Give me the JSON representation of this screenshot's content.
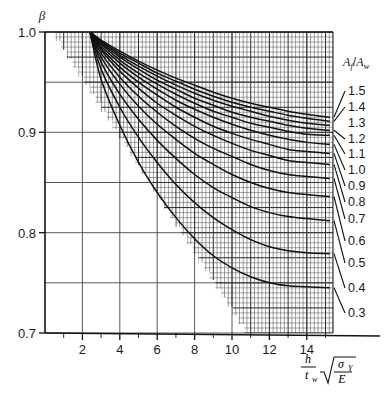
{
  "chart_data": {
    "type": "line",
    "title": "",
    "ylabel": "β",
    "xlabel": "(h/t_w)√(σ_y/E)",
    "xlabel_parts": {
      "num": "h",
      "den": "t",
      "den_sub": "w",
      "radicand_num": "σ",
      "radicand_num_sub": "Y",
      "radicand_den": "E"
    },
    "xlim": [
      0,
      15.4
    ],
    "ylim": [
      0.7,
      1.0
    ],
    "xticks": [
      2,
      4,
      6,
      8,
      10,
      12,
      14
    ],
    "xtick_labels": [
      "2",
      "4",
      "6",
      "8",
      "10",
      "12",
      "14"
    ],
    "yticks": [
      0.7,
      0.8,
      0.9,
      1.0
    ],
    "ytick_labels": [
      "0.7",
      "0.8",
      "0.9",
      "1.0"
    ],
    "y_minor_ticks": [
      0.75,
      0.85,
      0.95
    ],
    "grid": true,
    "grid_note": "fine rectangular mesh over upper-right wedge; coarse major grid over whole frame",
    "legend_position": "right",
    "legend_title": "Af/Aw",
    "legend_title_parts": {
      "main": "A",
      "sub1": "f",
      "slash": "/",
      "main2": "A",
      "sub2": "w"
    },
    "convergence_point": {
      "x": 2.4,
      "y": 1.0
    },
    "series": [
      {
        "name": "1.5",
        "label": "1.5",
        "end_y": 0.915,
        "points": [
          [
            2.4,
            1.0
          ],
          [
            3,
            0.992
          ],
          [
            4,
            0.981
          ],
          [
            5,
            0.971
          ],
          [
            6,
            0.962
          ],
          [
            7,
            0.954
          ],
          [
            8,
            0.947
          ],
          [
            9,
            0.94
          ],
          [
            10,
            0.934
          ],
          [
            11,
            0.929
          ],
          [
            12,
            0.925
          ],
          [
            13,
            0.921
          ],
          [
            14,
            0.918
          ],
          [
            15.2,
            0.915
          ]
        ]
      },
      {
        "name": "1.4",
        "label": "1.4",
        "end_y": 0.911,
        "points": [
          [
            2.4,
            1.0
          ],
          [
            3,
            0.991
          ],
          [
            4,
            0.979
          ],
          [
            5,
            0.969
          ],
          [
            6,
            0.959
          ],
          [
            7,
            0.951
          ],
          [
            8,
            0.943
          ],
          [
            9,
            0.936
          ],
          [
            10,
            0.93
          ],
          [
            11,
            0.925
          ],
          [
            12,
            0.921
          ],
          [
            13,
            0.917
          ],
          [
            14,
            0.914
          ],
          [
            15.2,
            0.911
          ]
        ]
      },
      {
        "name": "1.3",
        "label": "1.3",
        "end_y": 0.907,
        "points": [
          [
            2.4,
            1.0
          ],
          [
            3,
            0.99
          ],
          [
            4,
            0.977
          ],
          [
            5,
            0.966
          ],
          [
            6,
            0.956
          ],
          [
            7,
            0.947
          ],
          [
            8,
            0.939
          ],
          [
            9,
            0.932
          ],
          [
            10,
            0.926
          ],
          [
            11,
            0.921
          ],
          [
            12,
            0.916
          ],
          [
            13,
            0.912
          ],
          [
            14,
            0.909
          ],
          [
            15.2,
            0.907
          ]
        ]
      },
      {
        "name": "1.2",
        "label": "1.2",
        "end_y": 0.902,
        "points": [
          [
            2.4,
            1.0
          ],
          [
            3,
            0.989
          ],
          [
            4,
            0.975
          ],
          [
            5,
            0.963
          ],
          [
            6,
            0.952
          ],
          [
            7,
            0.943
          ],
          [
            8,
            0.934
          ],
          [
            9,
            0.927
          ],
          [
            10,
            0.92
          ],
          [
            11,
            0.915
          ],
          [
            12,
            0.911
          ],
          [
            13,
            0.907
          ],
          [
            14,
            0.904
          ],
          [
            15.2,
            0.902
          ]
        ]
      },
      {
        "name": "1.1",
        "label": "1.1",
        "end_y": 0.897,
        "points": [
          [
            2.4,
            1.0
          ],
          [
            3,
            0.988
          ],
          [
            4,
            0.972
          ],
          [
            5,
            0.959
          ],
          [
            6,
            0.948
          ],
          [
            7,
            0.938
          ],
          [
            8,
            0.929
          ],
          [
            9,
            0.921
          ],
          [
            10,
            0.915
          ],
          [
            11,
            0.909
          ],
          [
            12,
            0.905
          ],
          [
            13,
            0.901
          ],
          [
            14,
            0.898
          ],
          [
            15.2,
            0.897
          ]
        ]
      },
      {
        "name": "1.0",
        "label": "1.0",
        "end_y": 0.888,
        "points": [
          [
            2.4,
            1.0
          ],
          [
            3,
            0.986
          ],
          [
            4,
            0.969
          ],
          [
            5,
            0.955
          ],
          [
            6,
            0.943
          ],
          [
            7,
            0.932
          ],
          [
            8,
            0.923
          ],
          [
            9,
            0.915
          ],
          [
            10,
            0.908
          ],
          [
            11,
            0.902
          ],
          [
            12,
            0.897
          ],
          [
            13,
            0.893
          ],
          [
            14,
            0.89
          ],
          [
            15.2,
            0.888
          ]
        ]
      },
      {
        "name": "0.9",
        "label": "0.9",
        "end_y": 0.879,
        "points": [
          [
            2.4,
            1.0
          ],
          [
            3,
            0.984
          ],
          [
            4,
            0.965
          ],
          [
            5,
            0.95
          ],
          [
            6,
            0.937
          ],
          [
            7,
            0.925
          ],
          [
            8,
            0.915
          ],
          [
            9,
            0.906
          ],
          [
            10,
            0.899
          ],
          [
            11,
            0.893
          ],
          [
            12,
            0.888
          ],
          [
            13,
            0.883
          ],
          [
            14,
            0.881
          ],
          [
            15.2,
            0.879
          ]
        ]
      },
      {
        "name": "0.8",
        "label": "0.8",
        "end_y": 0.868,
        "points": [
          [
            2.4,
            1.0
          ],
          [
            3,
            0.982
          ],
          [
            4,
            0.961
          ],
          [
            5,
            0.944
          ],
          [
            6,
            0.929
          ],
          [
            7,
            0.917
          ],
          [
            8,
            0.906
          ],
          [
            9,
            0.897
          ],
          [
            10,
            0.889
          ],
          [
            11,
            0.882
          ],
          [
            12,
            0.877
          ],
          [
            13,
            0.872
          ],
          [
            14,
            0.87
          ],
          [
            15.2,
            0.868
          ]
        ]
      },
      {
        "name": "0.7",
        "label": "0.7",
        "end_y": 0.854,
        "points": [
          [
            2.4,
            1.0
          ],
          [
            3,
            0.979
          ],
          [
            4,
            0.955
          ],
          [
            5,
            0.936
          ],
          [
            6,
            0.92
          ],
          [
            7,
            0.906
          ],
          [
            8,
            0.894
          ],
          [
            9,
            0.884
          ],
          [
            10,
            0.876
          ],
          [
            11,
            0.868
          ],
          [
            12,
            0.862
          ],
          [
            13,
            0.858
          ],
          [
            14,
            0.856
          ],
          [
            15.2,
            0.854
          ]
        ]
      },
      {
        "name": "0.6",
        "label": "0.6",
        "end_y": 0.836,
        "points": [
          [
            2.4,
            1.0
          ],
          [
            3,
            0.975
          ],
          [
            4,
            0.948
          ],
          [
            5,
            0.926
          ],
          [
            6,
            0.908
          ],
          [
            7,
            0.893
          ],
          [
            8,
            0.879
          ],
          [
            9,
            0.868
          ],
          [
            10,
            0.858
          ],
          [
            11,
            0.85
          ],
          [
            12,
            0.844
          ],
          [
            13,
            0.84
          ],
          [
            14,
            0.838
          ],
          [
            15.2,
            0.836
          ]
        ]
      },
      {
        "name": "0.5",
        "label": "0.5",
        "end_y": 0.812,
        "points": [
          [
            2.4,
            1.0
          ],
          [
            3,
            0.97
          ],
          [
            4,
            0.938
          ],
          [
            5,
            0.913
          ],
          [
            6,
            0.892
          ],
          [
            7,
            0.874
          ],
          [
            8,
            0.858
          ],
          [
            9,
            0.845
          ],
          [
            10,
            0.835
          ],
          [
            11,
            0.826
          ],
          [
            12,
            0.82
          ],
          [
            13,
            0.816
          ],
          [
            14,
            0.814
          ],
          [
            15.2,
            0.812
          ]
        ]
      },
      {
        "name": "0.4",
        "label": "0.4",
        "end_y": 0.779,
        "points": [
          [
            2.4,
            1.0
          ],
          [
            3,
            0.963
          ],
          [
            4,
            0.925
          ],
          [
            5,
            0.895
          ],
          [
            6,
            0.87
          ],
          [
            7,
            0.848
          ],
          [
            8,
            0.83
          ],
          [
            9,
            0.815
          ],
          [
            10,
            0.803
          ],
          [
            11,
            0.793
          ],
          [
            12,
            0.786
          ],
          [
            13,
            0.782
          ],
          [
            14,
            0.78
          ],
          [
            15.2,
            0.779
          ]
        ]
      },
      {
        "name": "0.3",
        "label": "0.3",
        "end_y": 0.745,
        "points": [
          [
            2.4,
            1.0
          ],
          [
            3,
            0.953
          ],
          [
            4,
            0.907
          ],
          [
            5,
            0.87
          ],
          [
            6,
            0.84
          ],
          [
            7,
            0.815
          ],
          [
            8,
            0.794
          ],
          [
            9,
            0.777
          ],
          [
            10,
            0.765
          ],
          [
            11,
            0.756
          ],
          [
            12,
            0.75
          ],
          [
            13,
            0.747
          ],
          [
            14,
            0.746
          ],
          [
            15.2,
            0.745
          ]
        ]
      }
    ],
    "legend_entries": [
      "1.5",
      "1.4",
      "1.3",
      "1.2",
      "1.1",
      "1.0",
      "0.9",
      "0.8",
      "0.7",
      "0.6",
      "0.5",
      "0.4",
      "0.3"
    ],
    "colors": {
      "curve": "#111111",
      "grid_major": "#2a2a2a",
      "grid_minor": "#3a3a3a",
      "axis": "#111111",
      "background": "#ffffff"
    }
  }
}
